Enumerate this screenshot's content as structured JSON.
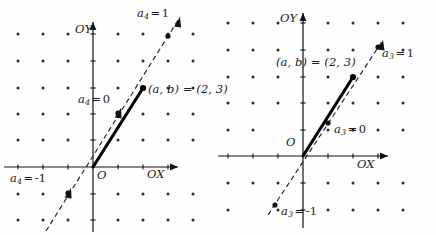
{
  "figure": {
    "type": "geometry-diagram",
    "panels": [
      {
        "id": "left",
        "index": 4,
        "origin_label": "O",
        "axis_x_label": "OX",
        "axis_y_label": "OY",
        "point_label": "(a, b) = (2, 3)",
        "point": {
          "x": 2,
          "y": 3
        },
        "vector": {
          "from": [
            0,
            0
          ],
          "to": [
            2,
            3
          ],
          "style": "solid-bold"
        },
        "dashed_line": {
          "slope": 1.5,
          "style": "dashed",
          "through": [
            0,
            0
          ]
        },
        "annotations": [
          {
            "name": "a4-eq-1",
            "var": "a",
            "sub": "4",
            "value": "1"
          },
          {
            "name": "a4-eq-0",
            "var": "a",
            "sub": "4",
            "value": "0"
          },
          {
            "name": "a4-eq-m1",
            "var": "a",
            "sub": "4",
            "value": "-1"
          }
        ],
        "lattice": {
          "cols": 7,
          "rows": 8,
          "dx": 25,
          "dy": 26.5
        }
      },
      {
        "id": "right",
        "index": 3,
        "origin_label": "O",
        "axis_x_label": "OX",
        "axis_y_label": "OY",
        "point_label": "(a, b) = (2, 3)",
        "point": {
          "x": 2,
          "y": 3
        },
        "vector": {
          "from": [
            0,
            0
          ],
          "to": [
            2,
            3
          ],
          "style": "solid-bold"
        },
        "dashed_line": {
          "slope": 1.32,
          "style": "dashed",
          "through": [
            0,
            0
          ]
        },
        "annotations": [
          {
            "name": "a3-eq-1",
            "var": "a",
            "sub": "3",
            "value": "1"
          },
          {
            "name": "a3-eq-0",
            "var": "a",
            "sub": "3",
            "value": "0"
          },
          {
            "name": "a3-eq-m1",
            "var": "a",
            "sub": "3",
            "value": "-1"
          }
        ],
        "lattice": {
          "cols": 7,
          "rows": 8,
          "dx": 25,
          "dy": 26.5
        }
      }
    ],
    "symbols": {
      "equals": "=",
      "minus": "−",
      "open_paren": "(",
      "close_paren": ")",
      "comma": ","
    },
    "colors": {
      "ink": "#1a1a1a",
      "background": "#fefefe",
      "lattice_dot": "#2b2b2b",
      "axis": "#111111",
      "vector": "#000000",
      "dashed": "#222222"
    }
  }
}
